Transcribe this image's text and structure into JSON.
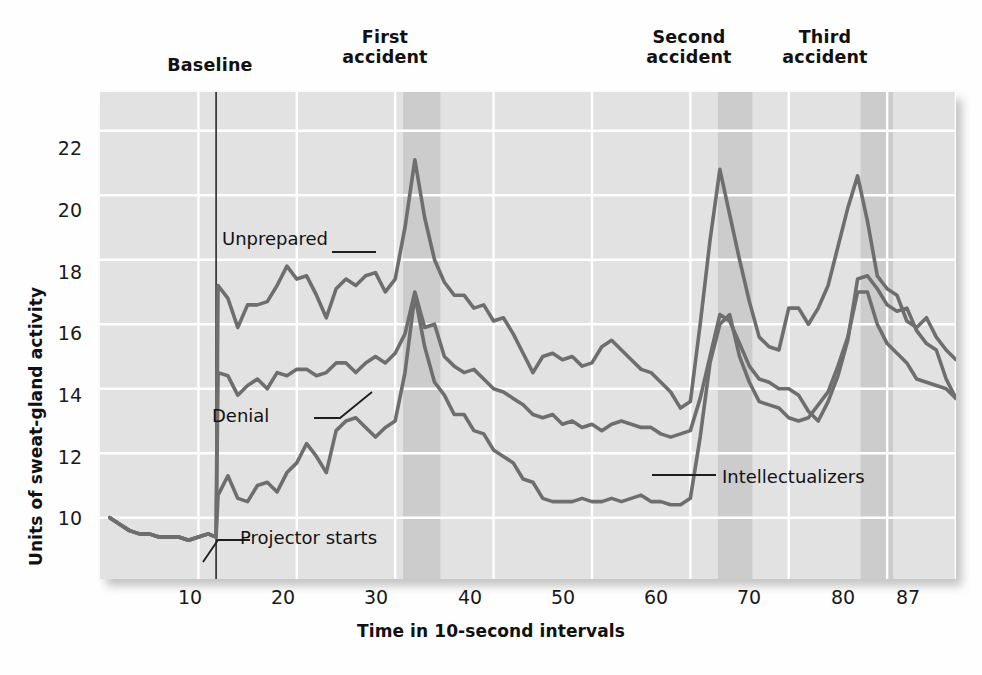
{
  "chart_data": {
    "type": "line",
    "title": "",
    "xlabel": "Time in 10-second intervals",
    "ylabel": "Units of sweat-gland activity",
    "xlim": [
      0,
      87
    ],
    "ylim": [
      8.1,
      23.2
    ],
    "xticks": [
      10,
      20,
      30,
      40,
      50,
      60,
      70,
      80,
      87
    ],
    "yticks": [
      10,
      12,
      14,
      16,
      18,
      20,
      22
    ],
    "grid": true,
    "legend_position": "inline-annotations",
    "line_color": "#6e6e6e",
    "plot_background": "#e2e2e2",
    "gridline_color": "#ffffff",
    "band_color": "#cccccc",
    "annotations": [
      {
        "name": "baseline",
        "label": "Baseline",
        "kind": "top-label",
        "x": 11.5
      },
      {
        "name": "first-accident",
        "label": "First\naccident",
        "kind": "top-label",
        "x": 32.5
      },
      {
        "name": "second-accident",
        "label": "Second\naccident",
        "kind": "top-label",
        "x": 64.0
      },
      {
        "name": "third-accident",
        "label": "Third\naccident",
        "kind": "top-label",
        "x": 79.0
      },
      {
        "name": "projector-starts",
        "label": "Projector starts",
        "kind": "inline",
        "x": 12.0
      },
      {
        "name": "unprepared",
        "label": "Unprepared",
        "kind": "series-label"
      },
      {
        "name": "denial",
        "label": "Denial",
        "kind": "series-label"
      },
      {
        "name": "intellectualizers",
        "label": "Intellectualizers",
        "kind": "series-label"
      }
    ],
    "event_bands": [
      {
        "name": "first-accident-band",
        "from": 30.8,
        "to": 34.6
      },
      {
        "name": "second-accident-band",
        "from": 62.8,
        "to": 66.3
      },
      {
        "name": "third-accident-band",
        "from": 77.3,
        "to": 80.6
      }
    ],
    "projector_start_x": 11.8,
    "series": [
      {
        "name": "Unprepared",
        "x": [
          1,
          2,
          3,
          4,
          5,
          6,
          7,
          8,
          9,
          10,
          11,
          11.8,
          12,
          13,
          14,
          15,
          16,
          17,
          18,
          19,
          20,
          21,
          22,
          23,
          24,
          25,
          26,
          27,
          28,
          29,
          30,
          31,
          32,
          33,
          34,
          35,
          36,
          37,
          38,
          39,
          40,
          41,
          42,
          43,
          44,
          45,
          46,
          47,
          48,
          49,
          50,
          51,
          52,
          53,
          54,
          55,
          56,
          57,
          58,
          59,
          60,
          61,
          62,
          63,
          64,
          65,
          66,
          67,
          68,
          69,
          70,
          71,
          72,
          73,
          74,
          75,
          76,
          77,
          78,
          79,
          80,
          81,
          82,
          83,
          84,
          85,
          86,
          87
        ],
        "values": [
          10.0,
          9.8,
          9.6,
          9.5,
          9.5,
          9.4,
          9.4,
          9.4,
          9.3,
          9.4,
          9.5,
          9.4,
          17.2,
          16.8,
          15.9,
          16.6,
          16.6,
          16.7,
          17.2,
          17.8,
          17.4,
          17.5,
          16.9,
          16.2,
          17.1,
          17.4,
          17.2,
          17.5,
          17.6,
          17.0,
          17.4,
          19.0,
          21.1,
          19.3,
          18.0,
          17.3,
          16.9,
          16.9,
          16.5,
          16.6,
          16.1,
          16.2,
          15.7,
          15.1,
          14.5,
          15.0,
          15.1,
          14.9,
          15.0,
          14.7,
          14.8,
          15.3,
          15.5,
          15.2,
          14.9,
          14.6,
          14.5,
          14.2,
          13.9,
          13.4,
          13.6,
          16.0,
          18.6,
          20.8,
          19.4,
          18.0,
          16.7,
          15.6,
          15.3,
          15.2,
          16.5,
          16.5,
          16.0,
          16.5,
          17.2,
          18.4,
          19.6,
          20.6,
          19.2,
          17.5,
          17.1,
          16.9,
          16.1,
          15.9,
          16.2,
          15.6,
          15.2,
          14.9
        ],
        "label_at": {
          "x": 24.0,
          "y": 19.2
        }
      },
      {
        "name": "Denial",
        "x": [
          1,
          2,
          3,
          4,
          5,
          6,
          7,
          8,
          9,
          10,
          11,
          11.8,
          12,
          13,
          14,
          15,
          16,
          17,
          18,
          19,
          20,
          21,
          22,
          23,
          24,
          25,
          26,
          27,
          28,
          29,
          30,
          31,
          32,
          33,
          34,
          35,
          36,
          37,
          38,
          39,
          40,
          41,
          42,
          43,
          44,
          45,
          46,
          47,
          48,
          49,
          50,
          51,
          52,
          53,
          54,
          55,
          56,
          57,
          58,
          59,
          60,
          61,
          62,
          63,
          64,
          65,
          66,
          67,
          68,
          69,
          70,
          71,
          72,
          73,
          74,
          75,
          76,
          77,
          78,
          79,
          80,
          81,
          82,
          83,
          84,
          85,
          86,
          87
        ],
        "values": [
          10.0,
          9.8,
          9.6,
          9.5,
          9.5,
          9.4,
          9.4,
          9.4,
          9.3,
          9.4,
          9.5,
          9.4,
          14.5,
          14.4,
          13.8,
          14.1,
          14.3,
          14.0,
          14.5,
          14.4,
          14.6,
          14.6,
          14.4,
          14.5,
          14.8,
          14.8,
          14.5,
          14.8,
          15.0,
          14.8,
          15.1,
          15.7,
          17.0,
          15.9,
          16.0,
          15.0,
          14.7,
          14.5,
          14.6,
          14.3,
          14.0,
          13.9,
          13.7,
          13.5,
          13.2,
          13.1,
          13.2,
          12.9,
          13.0,
          12.8,
          12.9,
          12.7,
          12.9,
          13.0,
          12.9,
          12.8,
          12.8,
          12.6,
          12.5,
          12.6,
          12.7,
          13.7,
          15.0,
          16.3,
          16.1,
          15.4,
          14.7,
          14.3,
          14.2,
          14.0,
          14.0,
          13.8,
          13.3,
          13.0,
          13.6,
          14.4,
          15.5,
          17.4,
          17.5,
          17.1,
          16.6,
          16.4,
          16.5,
          15.8,
          15.4,
          15.2,
          14.3,
          13.7
        ],
        "label_at": {
          "x": 22.0,
          "y": 13.5
        }
      },
      {
        "name": "Intellectualizers",
        "x": [
          1,
          2,
          3,
          4,
          5,
          6,
          7,
          8,
          9,
          10,
          11,
          11.8,
          12,
          13,
          14,
          15,
          16,
          17,
          18,
          19,
          20,
          21,
          22,
          23,
          24,
          25,
          26,
          27,
          28,
          29,
          30,
          31,
          32,
          33,
          34,
          35,
          36,
          37,
          38,
          39,
          40,
          41,
          42,
          43,
          44,
          45,
          46,
          47,
          48,
          49,
          50,
          51,
          52,
          53,
          54,
          55,
          56,
          57,
          58,
          59,
          60,
          61,
          62,
          63,
          64,
          65,
          66,
          67,
          68,
          69,
          70,
          71,
          72,
          73,
          74,
          75,
          76,
          77,
          78,
          79,
          80,
          81,
          82,
          83,
          84,
          85,
          86,
          87
        ],
        "values": [
          10.0,
          9.8,
          9.6,
          9.5,
          9.5,
          9.4,
          9.4,
          9.4,
          9.3,
          9.4,
          9.5,
          9.4,
          10.7,
          11.3,
          10.6,
          10.5,
          11.0,
          11.1,
          10.8,
          11.4,
          11.7,
          12.3,
          11.9,
          11.4,
          12.7,
          13.0,
          13.1,
          12.8,
          12.5,
          12.8,
          13.0,
          14.5,
          16.9,
          15.3,
          14.2,
          13.8,
          13.2,
          13.2,
          12.7,
          12.6,
          12.1,
          11.9,
          11.7,
          11.2,
          11.1,
          10.6,
          10.5,
          10.5,
          10.5,
          10.6,
          10.5,
          10.5,
          10.6,
          10.5,
          10.6,
          10.7,
          10.5,
          10.5,
          10.4,
          10.4,
          10.6,
          12.5,
          14.8,
          16.0,
          16.3,
          15.0,
          14.2,
          13.6,
          13.5,
          13.4,
          13.1,
          13.0,
          13.1,
          13.5,
          13.9,
          14.7,
          15.6,
          17.0,
          17.0,
          16.0,
          15.4,
          15.1,
          14.8,
          14.3,
          14.2,
          14.1,
          14.0,
          13.7
        ],
        "label_at": {
          "x": 69.0,
          "y": 11.6
        }
      }
    ]
  },
  "labels": {
    "baseline": "Baseline",
    "first_accident_line1": "First",
    "first_accident_line2": "accident",
    "second_accident_line1": "Second",
    "second_accident_line2": "accident",
    "third_accident_line1": "Third",
    "third_accident_line2": "accident",
    "projector_starts": "Projector starts",
    "unprepared": "Unprepared",
    "denial": "Denial",
    "intellectualizers": "Intellectualizers",
    "y_axis_title": "Units of sweat-gland activity",
    "x_axis_title": "Time in 10-second intervals"
  },
  "yticks": {
    "t10": "10",
    "t12": "12",
    "t14": "14",
    "t16": "16",
    "t18": "18",
    "t20": "20",
    "t22": "22"
  },
  "xticks": {
    "t10": "10",
    "t20": "20",
    "t30": "30",
    "t40": "40",
    "t50": "50",
    "t60": "60",
    "t70": "70",
    "t80": "80",
    "t87": "87"
  }
}
